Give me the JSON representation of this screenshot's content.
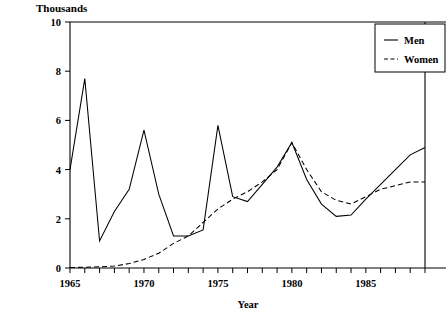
{
  "chart_data": {
    "type": "line",
    "title": "",
    "unit_label": "Thousands",
    "xlabel": "Year",
    "ylabel": "",
    "xlim": [
      1965,
      1989
    ],
    "ylim": [
      0,
      10
    ],
    "grid": false,
    "legend_position": "top-right",
    "y_ticks": [
      0,
      2,
      4,
      6,
      8,
      10
    ],
    "y_tick_labels": [
      "0",
      "2",
      "4",
      "6",
      "8",
      "10"
    ],
    "x_tick_labels": [
      "1965",
      "1970",
      "1975",
      "1980",
      "1985"
    ],
    "x_tick_label_values": [
      1965,
      1970,
      1975,
      1980,
      1985
    ],
    "x_minor_ticks": [
      1965,
      1966,
      1967,
      1968,
      1969,
      1970,
      1971,
      1972,
      1973,
      1974,
      1975,
      1976,
      1977,
      1978,
      1979,
      1980,
      1981,
      1982,
      1983,
      1984,
      1985,
      1986,
      1987,
      1988,
      1989
    ],
    "x": [
      1965,
      1966,
      1967,
      1968,
      1969,
      1970,
      1971,
      1972,
      1973,
      1974,
      1975,
      1976,
      1977,
      1978,
      1979,
      1980,
      1981,
      1982,
      1983,
      1984,
      1985,
      1986,
      1987,
      1988,
      1989
    ],
    "series": [
      {
        "name": "Men",
        "style": "solid",
        "color": "#000000",
        "values": [
          4.0,
          7.7,
          1.1,
          2.3,
          3.2,
          5.6,
          3.0,
          1.3,
          1.3,
          1.55,
          5.8,
          2.9,
          2.7,
          3.4,
          4.1,
          5.1,
          3.6,
          2.6,
          2.1,
          2.15,
          2.8,
          3.4,
          4.0,
          4.6,
          4.9
        ]
      },
      {
        "name": "Women",
        "style": "dashed",
        "color": "#000000",
        "values": [
          0.02,
          0.03,
          0.05,
          0.08,
          0.18,
          0.35,
          0.6,
          1.0,
          1.3,
          1.85,
          2.4,
          2.8,
          3.1,
          3.5,
          4.0,
          5.1,
          4.0,
          3.1,
          2.75,
          2.6,
          2.9,
          3.2,
          3.35,
          3.5,
          3.5
        ]
      }
    ]
  },
  "legend": {
    "items": [
      {
        "label": "Men",
        "style": "solid"
      },
      {
        "label": "Women",
        "style": "dashed"
      }
    ]
  },
  "labels": {
    "unit": "Thousands",
    "xaxis": "Year"
  }
}
